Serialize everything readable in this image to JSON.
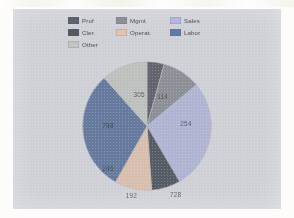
{
  "panel": {
    "background": "#cfd0d6"
  },
  "legend": {
    "items": [
      {
        "label": "Prof",
        "color": "#5e6270",
        "column": 1,
        "row": 1
      },
      {
        "label": "Cler.",
        "color": "#525964",
        "column": 1,
        "row": 2
      },
      {
        "label": "Other",
        "color": "#c0c6c2",
        "column": 1,
        "row": 3
      },
      {
        "label": "Mgmt",
        "color": "#8d9099",
        "column": 2,
        "row": 1
      },
      {
        "label": "Operat.",
        "color": "#e3c3ab",
        "column": 2,
        "row": 2
      },
      {
        "label": "Sales",
        "color": "#b4b6e0",
        "column": 3,
        "row": 1
      },
      {
        "label": "Labor",
        "color": "#5f7aa8",
        "column": 3,
        "row": 2
      }
    ]
  },
  "chart_data": {
    "type": "pie",
    "title": "",
    "legend_position": "top",
    "start_angle_deg": 0,
    "direction": "clockwise",
    "total": 2638,
    "categories": [
      "Prof",
      "Mgmt",
      "Sales",
      "Cler.",
      "Operat.",
      "Labor",
      "Other"
    ],
    "values": [
      114,
      254,
      728,
      192,
      246,
      798,
      305
    ],
    "colors": [
      "#5e6270",
      "#8d9099",
      "#b4b6e0",
      "#525964",
      "#e3c3ab",
      "#5f7aa8",
      "#c0c6c2"
    ],
    "labels": [
      "114",
      "254",
      "728",
      "192",
      "246",
      "798",
      "305"
    ],
    "label_positions": [
      {
        "x": 62,
        "y": 27
      },
      {
        "x": 80,
        "y": 48
      },
      {
        "x": 72,
        "y": 102
      },
      {
        "x": 38,
        "y": 103
      },
      {
        "x": 20,
        "y": 82
      },
      {
        "x": 20,
        "y": 49
      },
      {
        "x": 44,
        "y": 25
      }
    ]
  }
}
